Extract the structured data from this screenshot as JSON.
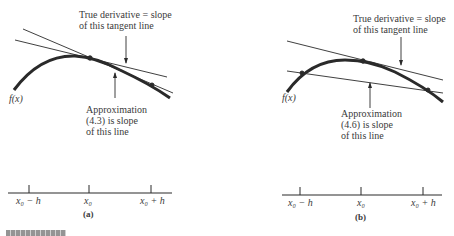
{
  "panels": [
    {
      "id": "a",
      "caption": "(a)",
      "function_label": "f(x)",
      "true_derivative_label": [
        "True derivative = slope",
        "of this tangent line"
      ],
      "approximation_label": [
        "Approximation",
        "(4.3) is slope",
        "of this line"
      ],
      "axis_ticks": [
        "x₀ − h",
        "x₀",
        "x₀ + h"
      ]
    },
    {
      "id": "b",
      "caption": "(b)",
      "function_label": "f(x)",
      "true_derivative_label": [
        "True derivative = slope",
        "of this tangent line"
      ],
      "approximation_label": [
        "Approximation",
        "(4.6) is slope",
        "of this line"
      ],
      "axis_ticks": [
        "x₀ − h",
        "x₀",
        "x₀ + h"
      ]
    }
  ],
  "colors": {
    "ink": "#2a2a2a",
    "background": "#ffffff"
  }
}
